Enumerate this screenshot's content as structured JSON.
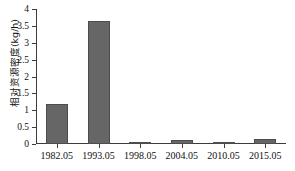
{
  "chart_data": {
    "type": "bar",
    "title": "",
    "xlabel": "",
    "ylabel": "相对资源密度(kg/h)",
    "categories": [
      "1982.05",
      "1993.05",
      "1998.05",
      "2004.05",
      "2010.05",
      "2015.05"
    ],
    "values": [
      1.2,
      3.65,
      0.04,
      0.13,
      0.07,
      0.14
    ],
    "ylim": [
      0,
      4
    ],
    "ytick_values": [
      0,
      0.5,
      1,
      1.5,
      2,
      2.5,
      3,
      3.5,
      4
    ],
    "ytick_labels": [
      "0",
      "0.5",
      "1",
      "1.5",
      "2",
      "2.5",
      "3",
      "3.5",
      "4"
    ],
    "grid": false,
    "legend": null,
    "bar_color": "#666666",
    "bar_edge_color": "#4d4d4d",
    "axis_color": "#3c3c3c",
    "background": "#ffffff"
  }
}
